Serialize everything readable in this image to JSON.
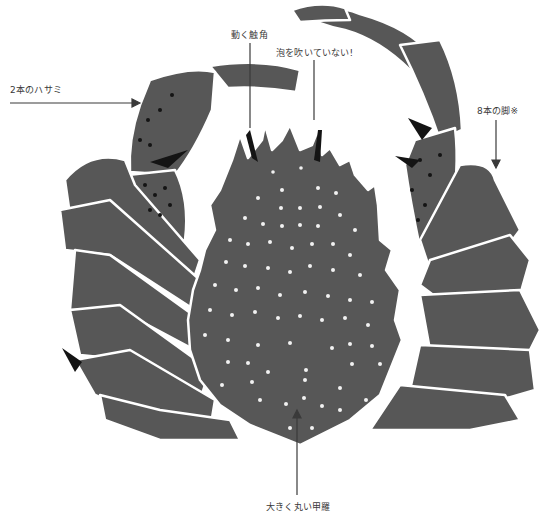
{
  "diagram": {
    "colors": {
      "body": "#575757",
      "outline": "#ffffff",
      "spine": "#141414",
      "spot": "#f2f2f2",
      "label_text": "#3a3a3a",
      "arrow": "#3a3a3a",
      "background": "#ffffff"
    },
    "labels": [
      {
        "id": "claws",
        "text": "2本のハサミ"
      },
      {
        "id": "antennae",
        "text": "動く触角"
      },
      {
        "id": "bubbles",
        "text": "泡を吹いていない!"
      },
      {
        "id": "legs",
        "text": "8本の脚※"
      },
      {
        "id": "shell",
        "text": "大きく丸い甲羅"
      }
    ]
  }
}
